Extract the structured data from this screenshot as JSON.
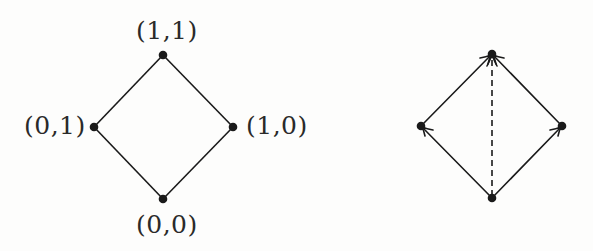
{
  "diagrams": {
    "lattice": {
      "nodes": [
        {
          "id": "top",
          "label": "(1,1)",
          "x": 163,
          "y": 55
        },
        {
          "id": "left",
          "label": "(0,1)",
          "x": 94,
          "y": 127
        },
        {
          "id": "right",
          "label": "(1,0)",
          "x": 233,
          "y": 127
        },
        {
          "id": "bottom",
          "label": "(0,0)",
          "x": 163,
          "y": 199
        }
      ],
      "edges": [
        {
          "from": "left",
          "to": "top",
          "style": "solid",
          "arrow": false
        },
        {
          "from": "right",
          "to": "top",
          "style": "solid",
          "arrow": false
        },
        {
          "from": "bottom",
          "to": "left",
          "style": "solid",
          "arrow": false
        },
        {
          "from": "bottom",
          "to": "right",
          "style": "solid",
          "arrow": false
        }
      ]
    },
    "directed": {
      "nodes": [
        {
          "id": "top",
          "x": 492,
          "y": 54
        },
        {
          "id": "left",
          "x": 421,
          "y": 126
        },
        {
          "id": "right",
          "x": 562,
          "y": 126
        },
        {
          "id": "bottom",
          "x": 492,
          "y": 198
        }
      ],
      "edges": [
        {
          "from": "left",
          "to": "top",
          "style": "solid",
          "arrow": true
        },
        {
          "from": "right",
          "to": "top",
          "style": "solid",
          "arrow": true
        },
        {
          "from": "bottom",
          "to": "left",
          "style": "solid",
          "arrow": true
        },
        {
          "from": "bottom",
          "to": "right",
          "style": "solid",
          "arrow": true
        },
        {
          "from": "bottom",
          "to": "top",
          "style": "dashed",
          "arrow": true
        }
      ]
    }
  },
  "colors": {
    "ink": "#1a1a1a",
    "background": "#fdfdfc"
  }
}
